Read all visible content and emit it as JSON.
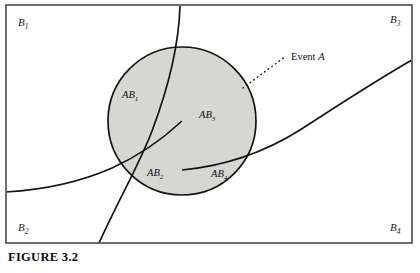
{
  "figure": {
    "caption": "FIGURE 3.2",
    "colors": {
      "page_background": "#ffffff",
      "frame_stroke": "#4a4a4a",
      "curve_stroke": "#141414",
      "event_fill": "#d6d6d3",
      "event_stroke": "#141414",
      "text": "#111111"
    },
    "frame": {
      "x": 6,
      "y": 5,
      "width": 406,
      "height": 238
    },
    "event_circle": {
      "cx": 182,
      "cy": 121,
      "r": 74,
      "label": "Event A",
      "label_text": "Event ",
      "label_italic": "A",
      "label_x": 291,
      "label_y": 60,
      "leader_from_x": 243,
      "leader_from_y": 88,
      "leader_to_x": 286,
      "leader_to_y": 56
    },
    "partition_labels": [
      {
        "name": "B1",
        "base": "B",
        "sub": "1",
        "x": 18,
        "y": 26
      },
      {
        "name": "B3",
        "base": "B",
        "sub": "3",
        "x": 390,
        "y": 23
      },
      {
        "name": "B2",
        "base": "B",
        "sub": "2",
        "x": 18,
        "y": 231
      },
      {
        "name": "B4",
        "base": "B",
        "sub": "4",
        "x": 390,
        "y": 231
      }
    ],
    "intersection_labels": [
      {
        "name": "AB1",
        "base": "AB",
        "sub": "1",
        "x": 122,
        "y": 98
      },
      {
        "name": "AB3",
        "base": "AB",
        "sub": "3",
        "x": 199,
        "y": 118
      },
      {
        "name": "AB2",
        "base": "AB",
        "sub": "2",
        "x": 147,
        "y": 176
      },
      {
        "name": "AB4",
        "base": "AB",
        "sub": "4",
        "x": 211,
        "y": 177
      }
    ],
    "boundary_curves": [
      {
        "name": "curve-b1-b3-divider",
        "path": "M 180 6 C 179 40 172 78 152 131 C 140 163 120 197 99 243"
      },
      {
        "name": "curve-b1-b2-divider",
        "path": "M 6 192 C 40 190 78 183 112 168 C 143 154 168 134 182 121"
      },
      {
        "name": "curve-b3-b4-divider",
        "path": "M 412 60 C 380 78 340 104 300 130 C 265 152 225 166 182 170"
      }
    ]
  }
}
